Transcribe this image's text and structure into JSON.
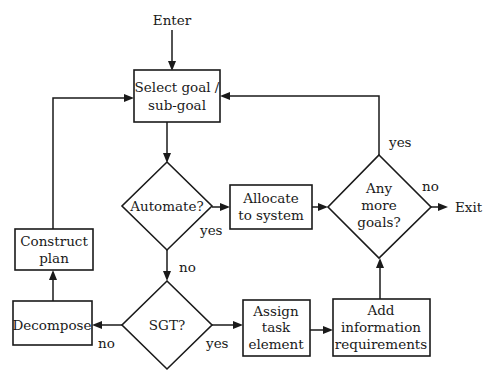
{
  "diagram": {
    "type": "flowchart",
    "terminals": {
      "enter": "Enter",
      "exit": "Exit"
    },
    "nodes": {
      "select_goal": {
        "kind": "process",
        "lines": [
          "Select goal /",
          "sub-goal"
        ]
      },
      "automate": {
        "kind": "decision",
        "lines": [
          "Automate?"
        ]
      },
      "allocate": {
        "kind": "process",
        "lines": [
          "Allocate",
          "to system"
        ]
      },
      "any_more_goals": {
        "kind": "decision",
        "lines": [
          "Any",
          "more",
          "goals?"
        ]
      },
      "construct_plan": {
        "kind": "process",
        "lines": [
          "Construct",
          "plan"
        ]
      },
      "decompose": {
        "kind": "process",
        "lines": [
          "Decompose"
        ]
      },
      "sgt": {
        "kind": "decision",
        "lines": [
          "SGT?"
        ]
      },
      "assign_task": {
        "kind": "process",
        "lines": [
          "Assign",
          "task",
          "element"
        ]
      },
      "add_info": {
        "kind": "process",
        "lines": [
          "Add",
          "information",
          "requirements"
        ]
      }
    },
    "edge_labels": {
      "automate_yes": "yes",
      "automate_no": "no",
      "sgt_no": "no",
      "sgt_yes": "yes",
      "goals_yes": "yes",
      "goals_no": "no"
    },
    "edges": [
      [
        "enter",
        "select_goal"
      ],
      [
        "select_goal",
        "automate"
      ],
      [
        "automate",
        "allocate",
        "yes"
      ],
      [
        "allocate",
        "any_more_goals"
      ],
      [
        "automate",
        "sgt",
        "no"
      ],
      [
        "sgt",
        "decompose",
        "no"
      ],
      [
        "sgt",
        "assign_task",
        "yes"
      ],
      [
        "decompose",
        "construct_plan"
      ],
      [
        "construct_plan",
        "select_goal"
      ],
      [
        "assign_task",
        "add_info"
      ],
      [
        "add_info",
        "any_more_goals"
      ],
      [
        "any_more_goals",
        "select_goal",
        "yes"
      ],
      [
        "any_more_goals",
        "exit",
        "no"
      ]
    ]
  }
}
